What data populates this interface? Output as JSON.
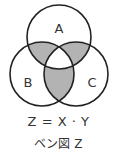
{
  "diagram": {
    "type": "venn",
    "sets": [
      {
        "name": "A",
        "cx": 59,
        "cy": 37,
        "r": 32
      },
      {
        "name": "B",
        "cx": 42,
        "cy": 74,
        "r": 32
      },
      {
        "name": "C",
        "cx": 76,
        "cy": 74,
        "r": 32
      }
    ],
    "shaded_regions": [
      "A∩B∖C",
      "A∩C∖B",
      "B∩C∖A"
    ],
    "shade_color": "#b3b3b3",
    "stroke_color": "#222222",
    "labels": {
      "a": "A",
      "b": "B",
      "c": "C"
    }
  },
  "caption": {
    "formula": "Z = X · Y",
    "title": "ベン図 Z"
  }
}
